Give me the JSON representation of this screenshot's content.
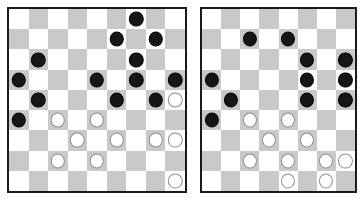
{
  "scene": {
    "title": "Two checkers boards side by side",
    "background_color": "#ffffff"
  },
  "style": {
    "light_square_color": "#ffffff",
    "dark_square_color": "#c9c9c9",
    "black_piece_color": "#161616",
    "white_piece_color": "#ffffff",
    "white_piece_outline": "#8d8d8d",
    "border_color": "#1a1a1a"
  },
  "boards": [
    {
      "id": "board-left",
      "label": "left-board",
      "columns": 9,
      "rows": 9,
      "dark_square_parity": 1,
      "black_piece_count": 13,
      "white_piece_count": 14,
      "grid": [
        [
          "",
          "",
          "",
          "",
          "",
          "",
          "b",
          "",
          ""
        ],
        [
          "",
          "",
          "",
          "",
          "",
          "b",
          "",
          "b",
          ""
        ],
        [
          "",
          "b",
          "",
          "",
          "",
          "",
          "b",
          "",
          ""
        ],
        [
          "b",
          "",
          "",
          "",
          "b",
          "",
          "b",
          "",
          "b"
        ],
        [
          "",
          "b",
          "",
          "",
          "",
          "b",
          "",
          "b",
          "w"
        ],
        [
          "b",
          "",
          "w",
          "",
          "w",
          "",
          "",
          "",
          ""
        ],
        [
          "",
          "",
          "",
          "w",
          "",
          "w",
          "",
          "w",
          "w"
        ],
        [
          "",
          "",
          "w",
          "",
          "w",
          "",
          "",
          "",
          ""
        ],
        [
          "",
          "",
          "",
          "",
          "",
          "",
          "",
          "",
          "w"
        ]
      ]
    },
    {
      "id": "board-right",
      "label": "right-board",
      "columns": 8,
      "rows": 9,
      "dark_square_parity": 1,
      "black_piece_count": 12,
      "white_piece_count": 10,
      "grid": [
        [
          "",
          "",
          "",
          "",
          "",
          "",
          "",
          ""
        ],
        [
          "",
          "",
          "b",
          "",
          "b",
          "",
          "",
          ""
        ],
        [
          "",
          "",
          "",
          "",
          "",
          "b",
          "",
          "b"
        ],
        [
          "b",
          "",
          "",
          "",
          "",
          "b",
          "",
          "b"
        ],
        [
          "",
          "b",
          "",
          "",
          "",
          "b",
          "",
          "b"
        ],
        [
          "b",
          "",
          "w",
          "",
          "w",
          "",
          "",
          ""
        ],
        [
          "",
          "",
          "",
          "w",
          "",
          "w",
          "",
          ""
        ],
        [
          "",
          "",
          "w",
          "",
          "w",
          "",
          "w",
          "w"
        ],
        [
          "",
          "",
          "",
          "",
          "",
          "",
          "",
          ""
        ]
      ]
    }
  ],
  "extra_rows": {
    "board_right_last_row": [
      "",
      "",
      "",
      "",
      "w",
      "",
      "w",
      ""
    ]
  }
}
